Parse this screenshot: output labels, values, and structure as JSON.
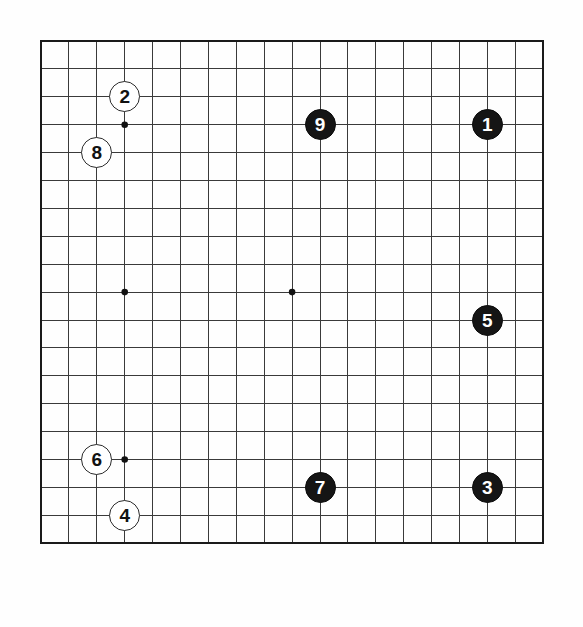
{
  "diagram": {
    "kind": "go-board-diagram",
    "board_size": 19,
    "board_label": "19x19 Go board",
    "background_color": "#fefefe",
    "line_color": "#3a3a3a",
    "border_color": "#1a1a1a",
    "black_stone_color": "#151515",
    "white_stone_color": "#ffffff",
    "black_label_color": "#ffffff",
    "white_label_color": "#111111",
    "geometry": {
      "origin_x": 41,
      "origin_y": 41,
      "spacing_x": 27.9,
      "spacing_y": 27.9,
      "stone_diameter": 31
    },
    "star_points": [
      {
        "col": 4,
        "row": 4
      },
      {
        "col": 10,
        "row": 4
      },
      {
        "col": 16,
        "row": 4
      },
      {
        "col": 4,
        "row": 10
      },
      {
        "col": 10,
        "row": 10
      },
      {
        "col": 16,
        "row": 10
      },
      {
        "col": 4,
        "row": 16
      },
      {
        "col": 10,
        "row": 16
      },
      {
        "col": 16,
        "row": 16
      }
    ],
    "star_points_hidden_by_stones": [
      {
        "col": 16,
        "row": 4
      },
      {
        "col": 16,
        "row": 10
      },
      {
        "col": 16,
        "row": 16
      },
      {
        "col": 10,
        "row": 4
      },
      {
        "col": 10,
        "row": 16
      }
    ],
    "stones": [
      {
        "label": "1",
        "color": "black",
        "col": 17,
        "row": 4
      },
      {
        "label": "2",
        "color": "white",
        "col": 4,
        "row": 3
      },
      {
        "label": "3",
        "color": "black",
        "col": 17,
        "row": 17
      },
      {
        "label": "4",
        "color": "white",
        "col": 4,
        "row": 18
      },
      {
        "label": "5",
        "color": "black",
        "col": 17,
        "row": 11
      },
      {
        "label": "6",
        "color": "white",
        "col": 3,
        "row": 16
      },
      {
        "label": "7",
        "color": "black",
        "col": 11,
        "row": 17
      },
      {
        "label": "8",
        "color": "white",
        "col": 3,
        "row": 5
      },
      {
        "label": "9",
        "color": "black",
        "col": 11,
        "row": 4
      }
    ]
  }
}
